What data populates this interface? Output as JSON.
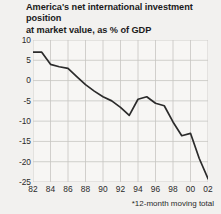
{
  "chart_data": {
    "type": "line",
    "title": "America's net international investment position at market value, as % of GDP",
    "title_line1": "America's net international investment position",
    "title_line2": "at market value, as % of GDP",
    "xlabel": "",
    "ylabel": "",
    "footnote": "*12-month moving total",
    "grid": true,
    "legend": "none",
    "ylim": [
      -25,
      10
    ],
    "xlim": [
      1982,
      2002
    ],
    "y_ticks": [
      10,
      5,
      0,
      -5,
      -10,
      -15,
      -20,
      -25
    ],
    "y_tick_labels": [
      "10",
      "5",
      "0",
      "-5",
      "-10",
      "-15",
      "-20",
      "-25"
    ],
    "x_ticks": [
      1982,
      1984,
      1986,
      1988,
      1990,
      1992,
      1994,
      1996,
      1998,
      2000,
      2002
    ],
    "x_tick_labels": [
      "82",
      "84",
      "86",
      "88",
      "90",
      "92",
      "94",
      "96",
      "98",
      "00",
      "02"
    ],
    "x": [
      1982,
      1983,
      1984,
      1985,
      1986,
      1987,
      1988,
      1989,
      1990,
      1991,
      1992,
      1993,
      1994,
      1995,
      1996,
      1997,
      1998,
      1999,
      2000,
      2001,
      2002
    ],
    "values": [
      7.0,
      7.0,
      4.0,
      3.4,
      3.0,
      1.0,
      -1.0,
      -2.6,
      -4.0,
      -5.0,
      -6.6,
      -8.6,
      -4.6,
      -4.0,
      -5.6,
      -6.2,
      -10.2,
      -13.6,
      -13.0,
      -19.2,
      -24.2
    ],
    "series": [
      {
        "name": "Net international investment position",
        "color": "#2b2b2b",
        "values": [
          7.0,
          7.0,
          4.0,
          3.4,
          3.0,
          1.0,
          -1.0,
          -2.6,
          -4.0,
          -5.0,
          -6.6,
          -8.6,
          -4.6,
          -4.0,
          -5.6,
          -6.2,
          -10.2,
          -13.6,
          -13.0,
          -19.2,
          -24.2
        ]
      }
    ]
  },
  "colors": {
    "background": "#f2f1ef",
    "plot_background": "#f7f6f4",
    "grid": "#c6c5c2",
    "line": "#2b2b2b",
    "text": "#1b1b1b"
  }
}
